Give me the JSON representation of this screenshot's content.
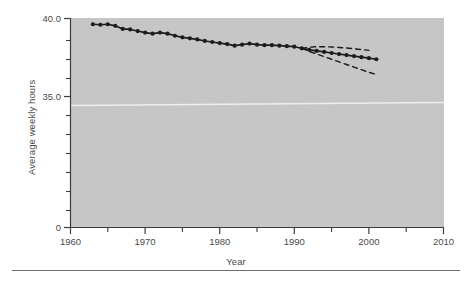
{
  "figure": {
    "background_color": "#ffffff",
    "plot_background_color": "#c9c9c9",
    "axis_color": "#3d3d3d",
    "series_color": "#1c1c1c",
    "artifact_line_color": "#f0f0f0"
  },
  "chart_data": {
    "type": "line",
    "title": "",
    "xlabel": "Year",
    "ylabel": "Average weekly hours",
    "xlim": [
      1960,
      2010
    ],
    "ylim": [
      0,
      40.0
    ],
    "xticks": [
      1960,
      1970,
      1980,
      1990,
      2000,
      2010
    ],
    "xtick_labels": [
      "1960",
      "1970",
      "1980",
      "1990",
      "2000",
      "2010"
    ],
    "xminor_ticks": [
      1965,
      1975,
      1985,
      1995,
      2005
    ],
    "yticks": [
      0,
      35.0,
      40.0
    ],
    "ytick_labels": [
      "0",
      "35.0",
      "40.0"
    ],
    "yminor_ticks": [
      4,
      8,
      12,
      16,
      20,
      24,
      28,
      32,
      36,
      38
    ],
    "grid": false,
    "legend": null,
    "y_axis_break": true,
    "series": [
      {
        "name": "Average weekly hours",
        "style": "solid-with-markers",
        "x": [
          1963,
          1964,
          1965,
          1966,
          1967,
          1968,
          1969,
          1970,
          1971,
          1972,
          1973,
          1974,
          1975,
          1976,
          1977,
          1978,
          1979,
          1980,
          1981,
          1982,
          1983,
          1984,
          1985,
          1986,
          1987,
          1988,
          1989,
          1990,
          1991,
          1992,
          1993,
          1994,
          1995,
          1996,
          1997,
          1998,
          1999,
          2000,
          2001
        ],
        "values": [
          38.9,
          38.8,
          38.9,
          38.6,
          38.0,
          37.9,
          37.6,
          37.3,
          37.1,
          37.3,
          37.1,
          36.7,
          36.4,
          36.2,
          36.0,
          35.7,
          35.5,
          35.3,
          35.1,
          34.8,
          35.0,
          35.2,
          35.0,
          34.9,
          34.9,
          34.8,
          34.7,
          34.6,
          34.3,
          34.0,
          33.8,
          33.6,
          33.4,
          33.2,
          33.0,
          32.8,
          32.6,
          32.4,
          32.2
        ]
      },
      {
        "name": "Upper projection bound",
        "style": "dashed",
        "x": [
          1991,
          1992,
          1993,
          1994,
          1995,
          1996,
          1997,
          1998,
          1999,
          2000
        ],
        "values": [
          34.3,
          34.5,
          34.6,
          34.6,
          34.55,
          34.45,
          34.35,
          34.2,
          34.05,
          33.9
        ]
      },
      {
        "name": "Lower projection bound",
        "style": "dashed",
        "x": [
          1991,
          1992,
          1993,
          1994,
          1995,
          1996,
          1997,
          1998,
          1999,
          2000,
          2001
        ],
        "values": [
          34.3,
          33.7,
          33.2,
          32.7,
          32.2,
          31.7,
          31.2,
          30.7,
          30.2,
          29.7,
          29.3
        ]
      }
    ]
  }
}
